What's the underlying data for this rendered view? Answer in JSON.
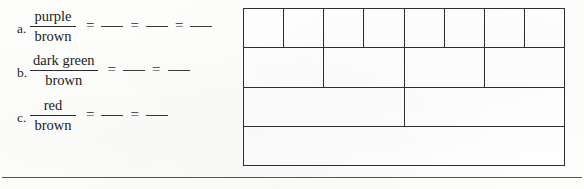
{
  "worksheet": {
    "exercises": [
      {
        "label": "a.",
        "numerator": "purple",
        "denominator": "brown",
        "equals": "=",
        "blanks": 3
      },
      {
        "label": "b.",
        "numerator": "dark green",
        "denominator": "brown",
        "equals": "=",
        "blanks": 2
      },
      {
        "label": "c.",
        "numerator": "red",
        "denominator": "brown",
        "equals": "=",
        "blanks": 2
      }
    ],
    "bar_model": {
      "rows": [
        {
          "cells": 8
        },
        {
          "cells": 4
        },
        {
          "cells": 2
        },
        {
          "cells": 1
        }
      ],
      "line_color": "#2e2e2e",
      "fill_color": "#fefefe"
    },
    "divider": {
      "color": "#555555"
    }
  }
}
